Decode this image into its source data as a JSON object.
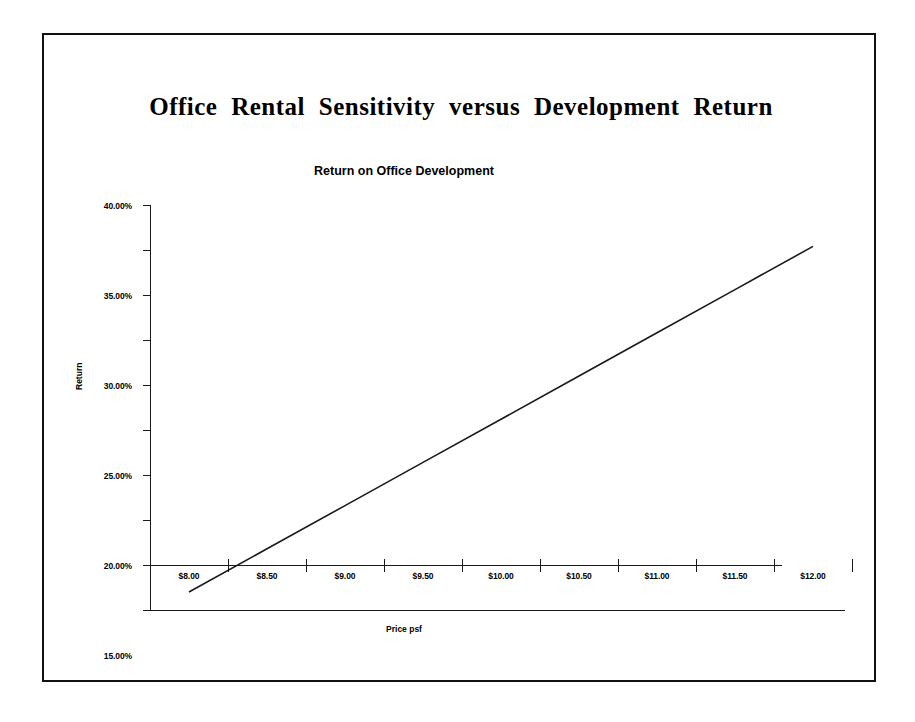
{
  "document": {
    "title": "Office Rental Sensitivity versus Development Return"
  },
  "chart_data": {
    "type": "line",
    "title": "Return on Office Development",
    "xlabel": "Price psf",
    "ylabel": "Return",
    "grid": false,
    "legend": "none",
    "categories": [
      "$8.00",
      "$8.50",
      "$9.00",
      "$9.50",
      "$10.00",
      "$10.50",
      "$11.00",
      "$11.50",
      "$12.00"
    ],
    "x": [
      8.0,
      8.5,
      9.0,
      9.5,
      10.0,
      10.5,
      11.0,
      11.5,
      12.0
    ],
    "series": [
      {
        "name": "Return",
        "values": [
          -0.03,
          0.018,
          0.066,
          0.114,
          0.162,
          0.21,
          0.258,
          0.306,
          0.354
        ]
      }
    ],
    "value_labels": [
      "-3.00%",
      "1.80%",
      "6.60%",
      "11.40%",
      "16.20%",
      "21.00%",
      "25.80%",
      "30.60%",
      "35.40%"
    ],
    "ylim": [
      -0.05,
      0.4
    ],
    "ytick_values": [
      0.4,
      0.35,
      0.3,
      0.25,
      0.2,
      0.15,
      0.1,
      0.05,
      0.0,
      -0.05
    ],
    "ytick_labels": [
      "40.00%",
      "35.00%",
      "30.00%",
      "25.00%",
      "20.00%",
      "15.00%",
      "10.00%",
      "5.00%",
      "0%",
      "-5.00%"
    ],
    "line_color": "#1a1a1a",
    "background_color": "#ffffff",
    "zero_crossing_x": 8.31
  }
}
